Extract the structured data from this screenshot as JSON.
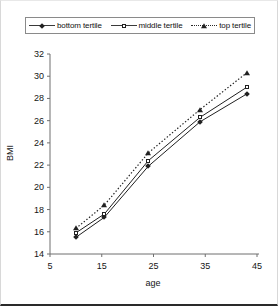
{
  "chart_data": {
    "type": "line",
    "title": "",
    "xlabel": "age",
    "ylabel": "BMI",
    "xlim": [
      5,
      45
    ],
    "ylim": [
      14,
      32
    ],
    "xticks": [
      5,
      15,
      25,
      35,
      45
    ],
    "yticks": [
      14,
      16,
      18,
      20,
      22,
      24,
      26,
      28,
      30,
      32
    ],
    "grid": false,
    "legend_position": "top",
    "x": [
      10,
      15.5,
      24,
      34,
      43
    ],
    "series": [
      {
        "name": "bottom tertile",
        "marker": "diamond",
        "linestyle": "solid",
        "color": "#202020",
        "values": [
          15.5,
          17.3,
          21.9,
          25.9,
          28.4
        ]
      },
      {
        "name": "middle tertile",
        "marker": "square",
        "linestyle": "solid",
        "color": "#202020",
        "values": [
          15.9,
          17.6,
          22.4,
          26.3,
          29.0
        ]
      },
      {
        "name": "top tertile",
        "marker": "triangle",
        "linestyle": "dotted",
        "color": "#202020",
        "values": [
          16.3,
          18.4,
          23.1,
          27.0,
          30.3
        ]
      }
    ]
  },
  "legend": {
    "entries": [
      {
        "label": "bottom tertile"
      },
      {
        "label": "middle tertile"
      },
      {
        "label": "top tertile"
      }
    ]
  },
  "axes": {
    "y_title": "BMI",
    "x_title": "age",
    "y_tick_labels": [
      "32",
      "30",
      "28",
      "26",
      "24",
      "22",
      "20",
      "18",
      "16",
      "14"
    ],
    "x_tick_labels": [
      "5",
      "15",
      "25",
      "35",
      "45"
    ]
  }
}
